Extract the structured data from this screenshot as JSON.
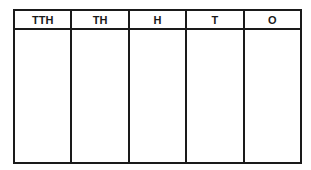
{
  "place_value_chart": {
    "columns": [
      {
        "label": "TTH"
      },
      {
        "label": "TH"
      },
      {
        "label": "H"
      },
      {
        "label": "T"
      },
      {
        "label": "O"
      }
    ]
  }
}
